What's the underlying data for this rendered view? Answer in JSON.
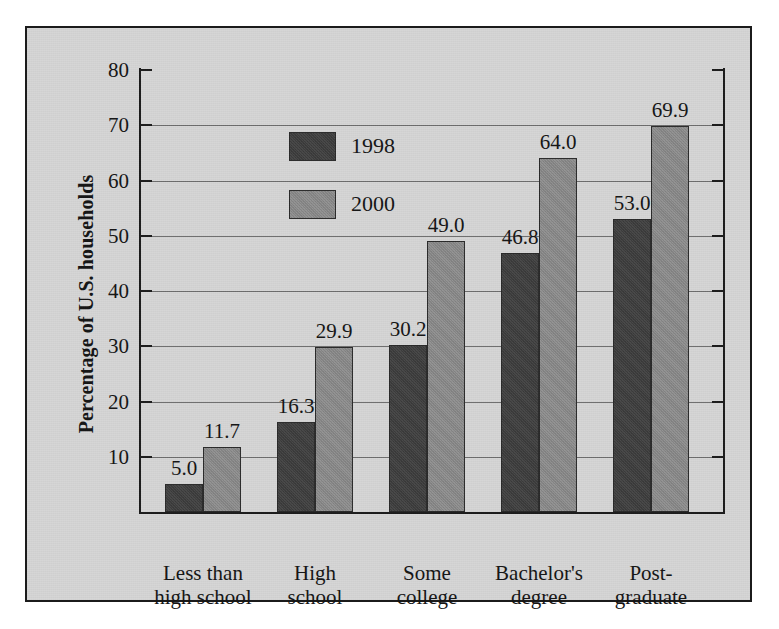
{
  "chart_data": {
    "type": "bar",
    "title": "",
    "xlabel": "",
    "ylabel": "Percentage of U.S. households",
    "ylim": [
      0,
      80
    ],
    "yticks": [
      10,
      20,
      30,
      40,
      50,
      60,
      70,
      80
    ],
    "ytick_labels": [
      "10",
      "20",
      "30",
      "40",
      "50",
      "60",
      "70",
      "80"
    ],
    "grid": true,
    "legend_position": "upper-left-inside",
    "categories": [
      "Less than\nhigh school",
      "High\nschool",
      "Some\ncollege",
      "Bachelor's\ndegree",
      "Post-\ngraduate"
    ],
    "series": [
      {
        "name": "1998",
        "color": "#3d3d3d",
        "values": [
          5.0,
          16.3,
          30.2,
          46.8,
          53.0
        ],
        "value_labels": [
          "5.0",
          "16.3",
          "30.2",
          "46.8",
          "53.0"
        ]
      },
      {
        "name": "2000",
        "color": "#8b8b8b",
        "values": [
          11.7,
          29.9,
          49.0,
          64.0,
          69.9
        ],
        "value_labels": [
          "11.7",
          "29.9",
          "49.0",
          "64.0",
          "69.9"
        ]
      }
    ]
  },
  "legend": {
    "entries": [
      {
        "label": "1998",
        "color": "#3d3d3d"
      },
      {
        "label": "2000",
        "color": "#8b8b8b"
      }
    ]
  },
  "axes": {
    "y_title": "Percentage of U.S. households"
  },
  "colors": {
    "panel_background": "#d6d6d6",
    "frame": "#1b1b1b",
    "gridline": "#6e6e6e",
    "series_1998": "#3d3d3d",
    "series_2000": "#8b8b8b",
    "text": "#141414"
  }
}
